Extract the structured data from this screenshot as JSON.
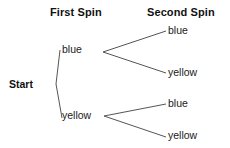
{
  "diagram": {
    "type": "probability-tree",
    "title": "",
    "background_color": "#ffffff",
    "line_color": "#555555",
    "text_color": "#1a1a1a",
    "headers": {
      "first_spin": "First Spin",
      "second_spin": "Second Spin"
    },
    "root": {
      "label": "Start"
    },
    "branches": {
      "first_spin": [
        {
          "label": "blue"
        },
        {
          "label": "yellow"
        }
      ],
      "second_spin_after_blue": [
        {
          "label": "blue"
        },
        {
          "label": "yellow"
        }
      ],
      "second_spin_after_yellow": [
        {
          "label": "blue"
        },
        {
          "label": "yellow"
        }
      ]
    }
  }
}
